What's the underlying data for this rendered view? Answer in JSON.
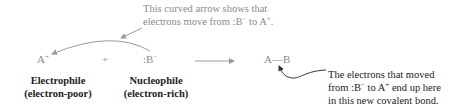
{
  "top_caption": {
    "line1": "This curved arrow shows that",
    "line2_prefix": "electrons move from ",
    "line2_b": ":B",
    "line2_b_charge": "−",
    "line2_mid": " to A",
    "line2_a_charge": "+",
    "line2_end": "."
  },
  "reaction": {
    "electrophile_symbol": "A",
    "electrophile_charge": "+",
    "plus": "+",
    "nucleophile_symbol": ":B",
    "nucleophile_charge": "−",
    "product": "A—B"
  },
  "labels": {
    "electrophile_title": "Electrophile",
    "electrophile_sub": "(electron-poor)",
    "nucleophile_title": "Nucleophile",
    "nucleophile_sub": "(electron-rich)"
  },
  "bottom_caption": {
    "line1": "The electrons that moved",
    "line2_prefix": "from ",
    "line2_b": ":B",
    "line2_b_charge": "−",
    "line2_mid": " to A",
    "line2_a_charge": "+",
    "line2_end": " end up here",
    "line3": "in this new covalent bond."
  },
  "colors": {
    "gray_text": "#8a8a8a",
    "dark_text": "#222222",
    "arrow_gray": "#9a9a9a",
    "arrow_dark": "#333333"
  }
}
